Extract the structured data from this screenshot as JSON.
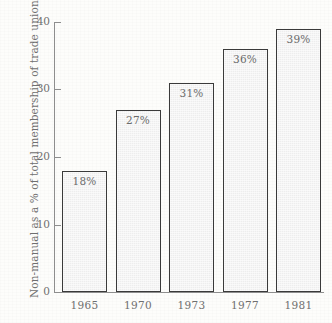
{
  "chart_data": {
    "type": "bar",
    "title": "",
    "subtitle": "",
    "xlabel": "",
    "ylabel": "Non-manual as a % of total membership of trade unions",
    "categories": [
      "1965",
      "1970",
      "1973",
      "1977",
      "1981"
    ],
    "values": [
      18,
      27,
      31,
      36,
      39
    ],
    "value_labels": [
      "18%",
      "27%",
      "31%",
      "36%",
      "39%"
    ],
    "ylim": [
      0,
      40
    ],
    "yticks": [
      0,
      10,
      20,
      30,
      40
    ],
    "ytick_labels": [
      "0",
      "10",
      "20",
      "30",
      "40"
    ],
    "grid": false,
    "legend": null,
    "series": [
      {
        "name": "Non-manual share of trade union membership",
        "values": [
          18,
          27,
          31,
          36,
          39
        ]
      }
    ],
    "annotations": []
  },
  "style": {
    "background_color": "#fdfdfb",
    "bar_fill_color": "#ededed",
    "bar_border_color": "#3a3a3a",
    "axis_color": "#8e8e8e",
    "text_color": "#6f6f6f"
  }
}
